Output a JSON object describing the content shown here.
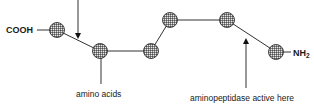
{
  "diagram": {
    "type": "peptide-chain",
    "terminal_left": "COOH",
    "terminal_right": {
      "text": "NH",
      "subscript": "2"
    },
    "nodes": [
      "amino-acid-1",
      "amino-acid-2",
      "amino-acid-3",
      "amino-acid-4",
      "amino-acid-5",
      "amino-acid-6"
    ],
    "labels": {
      "amino_acids": "amino acids",
      "aminopeptidase": "aminopeptidase active here"
    }
  }
}
